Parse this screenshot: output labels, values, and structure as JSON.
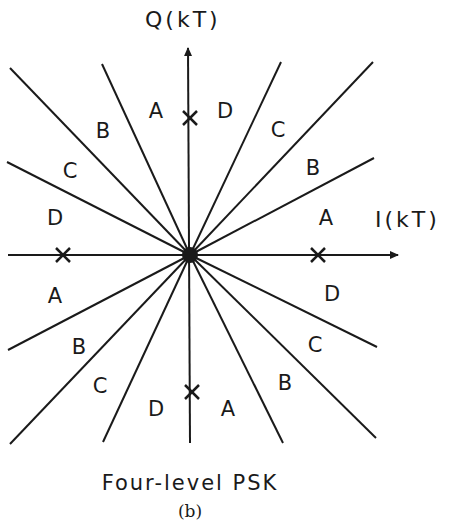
{
  "diagram": {
    "title": "Four-level PSK",
    "subcaption": "(b)",
    "axes": {
      "x_label": "I(kT)",
      "y_label": "Q(kT)"
    },
    "center": [
      190,
      255
    ],
    "colors": {
      "ink": "#1a1a1a",
      "background": "#ffffff"
    },
    "boundary_lines": [
      {
        "to": [
          10,
          68
        ]
      },
      {
        "to": [
          7,
          162
        ]
      },
      {
        "to": [
          102,
          64
        ]
      },
      {
        "to": [
          281,
          62
        ]
      },
      {
        "to": [
          373,
          62
        ]
      },
      {
        "to": [
          374,
          158
        ]
      },
      {
        "to": [
          8,
          350
        ]
      },
      {
        "to": [
          10,
          444
        ]
      },
      {
        "to": [
          103,
          442
        ]
      },
      {
        "to": [
          377,
          347
        ]
      },
      {
        "to": [
          376,
          438
        ]
      },
      {
        "to": [
          283,
          443
        ]
      }
    ],
    "constellation_points": [
      {
        "x": 190,
        "y": 118
      },
      {
        "x": 63,
        "y": 255
      },
      {
        "x": 318,
        "y": 255
      },
      {
        "x": 192,
        "y": 392
      }
    ],
    "region_labels": [
      {
        "text": "A",
        "x": 156,
        "y": 118
      },
      {
        "text": "D",
        "x": 225,
        "y": 118
      },
      {
        "text": "B",
        "x": 103,
        "y": 138
      },
      {
        "text": "C",
        "x": 278,
        "y": 137
      },
      {
        "text": "C",
        "x": 70,
        "y": 178
      },
      {
        "text": "B",
        "x": 313,
        "y": 175
      },
      {
        "text": "D",
        "x": 55,
        "y": 225
      },
      {
        "text": "A",
        "x": 326,
        "y": 225
      },
      {
        "text": "A",
        "x": 55,
        "y": 303
      },
      {
        "text": "D",
        "x": 332,
        "y": 301
      },
      {
        "text": "B",
        "x": 79,
        "y": 354
      },
      {
        "text": "C",
        "x": 315,
        "y": 352
      },
      {
        "text": "C",
        "x": 100,
        "y": 393
      },
      {
        "text": "B",
        "x": 285,
        "y": 390
      },
      {
        "text": "D",
        "x": 156,
        "y": 416
      },
      {
        "text": "A",
        "x": 228,
        "y": 416
      }
    ]
  }
}
